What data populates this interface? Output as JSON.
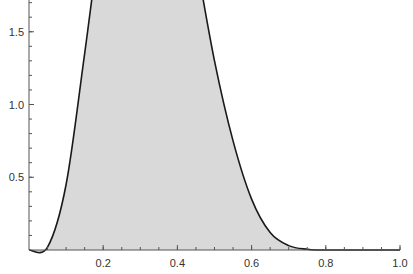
{
  "chart_data": {
    "type": "area",
    "title": "",
    "xlabel": "",
    "ylabel": "",
    "xlim": [
      0,
      1.0
    ],
    "ylim": [
      0,
      3.3
    ],
    "grid": false,
    "legend": null,
    "x_ticks": [
      0.2,
      0.4,
      0.6,
      0.8,
      1.0
    ],
    "x_tick_labels": [
      "0.2",
      "0.4",
      "0.6",
      "0.8",
      "1.0"
    ],
    "y_ticks": [
      0.5,
      1.0,
      1.5,
      2.0,
      2.5,
      3.0
    ],
    "y_tick_labels": [
      "0.5",
      "1.0",
      "1.5",
      "2.0",
      "2.5",
      "3.0"
    ],
    "peak": {
      "x": 0.31,
      "y": 3.27
    },
    "series": [
      {
        "name": "density",
        "x": [
          0.0,
          0.05,
          0.1,
          0.15,
          0.2,
          0.25,
          0.31,
          0.35,
          0.4,
          0.45,
          0.5,
          0.55,
          0.6,
          0.65,
          0.7,
          0.75,
          0.8,
          1.0
        ],
        "y": [
          0.0,
          0.02,
          0.45,
          1.35,
          2.3,
          3.0,
          3.27,
          3.15,
          2.7,
          2.0,
          1.3,
          0.75,
          0.35,
          0.12,
          0.03,
          0.005,
          0.0,
          0.0
        ]
      }
    ],
    "colors": {
      "fill": "#d9d9d9",
      "line": "#1a1a1a",
      "axis": "#555555",
      "text": "#333333"
    }
  }
}
